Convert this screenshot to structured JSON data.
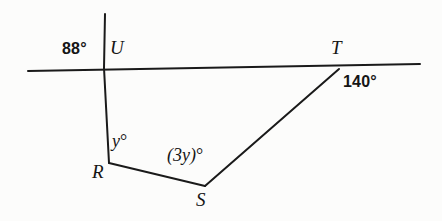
{
  "figure": {
    "type": "geometry-diagram",
    "background_color": "#fcfcfb",
    "stroke_color": "#1a1a1a",
    "points": {
      "U": {
        "label": "U",
        "x": 104,
        "y": 68
      },
      "R": {
        "label": "R",
        "x": 109,
        "y": 163
      },
      "S": {
        "label": "S",
        "x": 205,
        "y": 186
      },
      "T": {
        "label": "T",
        "x": 339,
        "y": 69
      }
    },
    "lines": [
      {
        "name": "horizontal-transversal",
        "x1": 28,
        "y1": 71,
        "x2": 420,
        "y2": 64
      },
      {
        "name": "vertical-ray-above-U",
        "x1": 105,
        "y1": 14,
        "x2": 104,
        "y2": 68
      },
      {
        "name": "segment-U-to-R",
        "x1": 104,
        "y1": 68,
        "x2": 109,
        "y2": 163
      },
      {
        "name": "segment-R-to-S",
        "x1": 109,
        "y1": 163,
        "x2": 205,
        "y2": 186
      },
      {
        "name": "segment-S-to-T",
        "x1": 205,
        "y1": 186,
        "x2": 339,
        "y2": 69
      }
    ],
    "labels": {
      "angle_at_U": "88°",
      "point_U": "U",
      "point_T": "T",
      "angle_at_T": "140°",
      "angle_at_R": "y°",
      "angle_at_R_variable": "y",
      "point_R": "R",
      "angle_at_S": "(3y)°",
      "angle_at_S_variable": "(3y)",
      "point_S": "S",
      "degree_symbol": "°"
    }
  }
}
